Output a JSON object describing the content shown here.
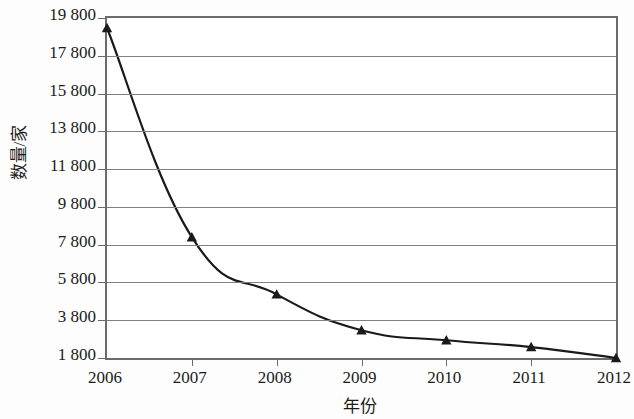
{
  "chart_data": {
    "type": "line",
    "title": "",
    "xlabel": "年份",
    "ylabel": "数量/家",
    "categories": [
      "2006",
      "2007",
      "2008",
      "2009",
      "2010",
      "2011",
      "2012"
    ],
    "x": [
      2006,
      2007,
      2008,
      2009,
      2010,
      2011,
      2012
    ],
    "values": [
      19270,
      8200,
      5170,
      3270,
      2740,
      2380,
      1800
    ],
    "series": [
      {
        "name": "数量/家",
        "values": [
          19270,
          8200,
          5170,
          3270,
          2740,
          2380,
          1800
        ]
      }
    ],
    "ylim": [
      1800,
      19800
    ],
    "xlim": [
      2006,
      2012
    ],
    "y_ticks": [
      1800,
      3800,
      5800,
      7800,
      9800,
      11800,
      13800,
      15800,
      17800,
      19800
    ],
    "y_tick_labels": [
      "1 800",
      "3 800",
      "5 800",
      "7 800",
      "9 800",
      "11 800",
      "13 800",
      "15 800",
      "17 800",
      "19 800"
    ],
    "grid": true,
    "grid_axis": "y",
    "legend": false,
    "legend_position": "none",
    "marker": "triangle",
    "line_color": "#1a1a1a",
    "marker_color": "#1a1a1a",
    "grid_color": "#808080",
    "axis_color": "#6b6b6b",
    "background_color": "#ffffff",
    "annotations": []
  }
}
